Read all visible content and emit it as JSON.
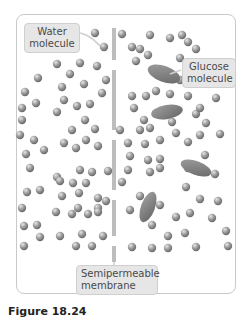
{
  "figure": {
    "labels": {
      "water": [
        "Water",
        "molecule"
      ],
      "glucose": [
        "Glucose",
        "molecule"
      ],
      "membrane": [
        "Semipermeable",
        "membrane"
      ]
    },
    "caption": "Figure 18.24",
    "colors": {
      "molecule": "#8a8a8a",
      "glucose": "#7a7a7a",
      "membrane": "#bdbdbd",
      "label_bg": "#e6e6e6",
      "panel_border": "#c9c9c9"
    },
    "membrane_segments": [
      [
        28,
        60
      ],
      [
        70,
        130
      ],
      [
        140,
        190
      ],
      [
        200,
        236
      ],
      [
        246,
        262
      ]
    ],
    "water_molecules_left": [
      [
        95,
        33
      ],
      [
        104,
        47
      ],
      [
        57,
        64
      ],
      [
        80,
        63
      ],
      [
        97,
        66
      ],
      [
        70,
        74
      ],
      [
        62,
        87
      ],
      [
        84,
        84
      ],
      [
        106,
        80
      ],
      [
        102,
        93
      ],
      [
        64,
        100
      ],
      [
        77,
        106
      ],
      [
        90,
        104
      ],
      [
        57,
        112
      ],
      [
        85,
        120
      ],
      [
        72,
        130
      ],
      [
        95,
        129
      ],
      [
        64,
        143
      ],
      [
        76,
        148
      ],
      [
        98,
        146
      ],
      [
        86,
        140
      ],
      [
        80,
        170
      ],
      [
        92,
        172
      ],
      [
        57,
        177
      ],
      [
        108,
        171
      ],
      [
        60,
        181
      ],
      [
        73,
        183
      ],
      [
        86,
        183
      ],
      [
        62,
        196
      ],
      [
        79,
        193
      ],
      [
        98,
        198
      ],
      [
        78,
        208
      ],
      [
        98,
        208
      ],
      [
        106,
        201
      ],
      [
        56,
        212
      ],
      [
        72,
        214
      ],
      [
        88,
        214
      ],
      [
        98,
        212
      ],
      [
        60,
        236
      ],
      [
        82,
        234
      ],
      [
        103,
        236
      ],
      [
        76,
        246
      ],
      [
        92,
        246
      ],
      [
        24,
        226
      ],
      [
        37,
        225
      ],
      [
        24,
        246
      ],
      [
        40,
        237
      ],
      [
        36,
        103
      ],
      [
        22,
        108
      ],
      [
        30,
        168
      ],
      [
        34,
        140
      ],
      [
        20,
        135
      ],
      [
        27,
        192
      ],
      [
        40,
        190
      ],
      [
        22,
        208
      ],
      [
        38,
        78
      ],
      [
        25,
        92
      ],
      [
        44,
        150
      ],
      [
        26,
        154
      ],
      [
        22,
        120
      ]
    ],
    "water_molecules_right": [
      [
        122,
        34
      ],
      [
        150,
        35
      ],
      [
        170,
        38
      ],
      [
        182,
        35
      ],
      [
        188,
        42
      ],
      [
        132,
        47
      ],
      [
        140,
        49
      ],
      [
        148,
        55
      ],
      [
        196,
        49
      ],
      [
        180,
        58
      ],
      [
        202,
        63
      ],
      [
        136,
        61
      ],
      [
        160,
        74
      ],
      [
        180,
        80
      ],
      [
        190,
        80
      ],
      [
        198,
        77
      ],
      [
        132,
        96
      ],
      [
        146,
        96
      ],
      [
        156,
        91
      ],
      [
        170,
        94
      ],
      [
        188,
        96
      ],
      [
        216,
        98
      ],
      [
        134,
        108
      ],
      [
        156,
        113
      ],
      [
        196,
        114
      ],
      [
        200,
        108
      ],
      [
        144,
        120
      ],
      [
        172,
        122
      ],
      [
        206,
        123
      ],
      [
        120,
        130
      ],
      [
        140,
        130
      ],
      [
        150,
        128
      ],
      [
        176,
        133
      ],
      [
        200,
        135
      ],
      [
        220,
        134
      ],
      [
        128,
        143
      ],
      [
        145,
        144
      ],
      [
        160,
        140
      ],
      [
        188,
        142
      ],
      [
        130,
        156
      ],
      [
        148,
        160
      ],
      [
        160,
        159
      ],
      [
        205,
        155
      ],
      [
        128,
        170
      ],
      [
        150,
        172
      ],
      [
        160,
        168
      ],
      [
        188,
        168
      ],
      [
        215,
        174
      ],
      [
        122,
        182
      ],
      [
        186,
        187
      ],
      [
        200,
        199
      ],
      [
        218,
        201
      ],
      [
        130,
        210
      ],
      [
        160,
        205
      ],
      [
        190,
        213
      ],
      [
        212,
        218
      ],
      [
        152,
        225
      ],
      [
        176,
        217
      ],
      [
        168,
        236
      ],
      [
        185,
        233
      ],
      [
        132,
        247
      ],
      [
        152,
        248
      ],
      [
        168,
        248
      ],
      [
        196,
        247
      ],
      [
        226,
        231
      ],
      [
        228,
        246
      ],
      [
        140,
        196
      ]
    ],
    "glucose_molecules": [
      {
        "cx": 164,
        "cy": 74,
        "rx": 17,
        "ry": 8,
        "rotate": 20
      },
      {
        "cx": 167,
        "cy": 112,
        "rx": 16,
        "ry": 7,
        "rotate": -10
      },
      {
        "cx": 196,
        "cy": 168,
        "rx": 16,
        "ry": 7,
        "rotate": 20
      },
      {
        "cx": 148,
        "cy": 207,
        "rx": 7,
        "ry": 16,
        "rotate": 20
      }
    ]
  }
}
